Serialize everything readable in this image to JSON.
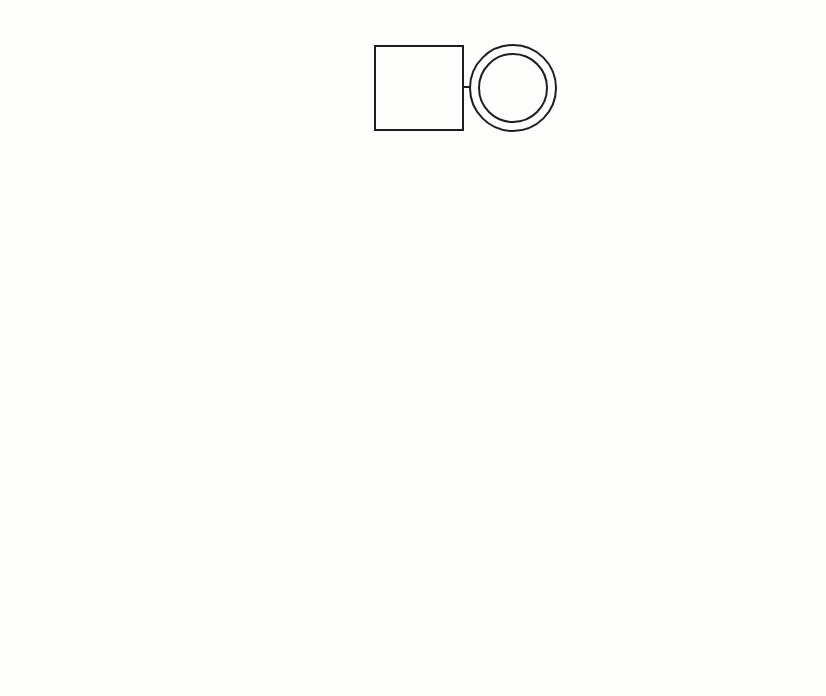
{
  "diagram": {
    "type": "genogram",
    "colors": {
      "stroke": "#1e1e1e",
      "background": "#fdfdfc",
      "text": "#1b1b1b"
    },
    "people": {
      "george": {
        "name": "George",
        "age": "74",
        "note": "Retired",
        "sex": "male"
      },
      "carrie": {
        "name": "Carrie",
        "age": "73",
        "note": "Retired",
        "sex": "female",
        "marker": "double-circle"
      },
      "alan": {
        "name": "Alan",
        "age": "49",
        "sex": "male"
      },
      "catherine": {
        "name": "Catherine",
        "age": "48",
        "sex": "female"
      },
      "ellen": {
        "name": "Ellen",
        "age": "47",
        "sex": "female"
      },
      "ellen_ex_husband": {
        "name": "",
        "age": "",
        "sex": "male"
      },
      "alan_daughter": {
        "age": "20",
        "sex": "female"
      },
      "alan_son": {
        "age": "18",
        "sex": "male"
      },
      "ellen_son": {
        "age": "21",
        "sex": "male"
      }
    },
    "relationships": {
      "divorce_label": "D. 15 years"
    }
  }
}
